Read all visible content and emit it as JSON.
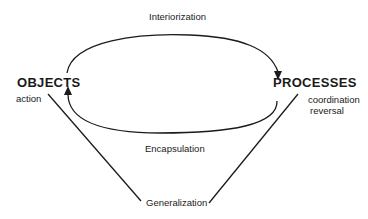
{
  "diagram": {
    "nodes": {
      "objects": {
        "label": "OBJECTS",
        "sublabels": [
          "action"
        ]
      },
      "processes": {
        "label": "PROCESSES",
        "sublabels": [
          "coordination",
          "reversal"
        ]
      }
    },
    "edges": {
      "interiorization": {
        "label": "Interiorization",
        "from": "OBJECTS",
        "to": "PROCESSES",
        "style": "upper arc with arrowhead"
      },
      "encapsulation": {
        "label": "Encapsulation",
        "from": "PROCESSES",
        "to": "OBJECTS",
        "style": "lower arc with arrowhead"
      },
      "generalization": {
        "label": "Generalization",
        "from": "OBJECTS",
        "to": "PROCESSES",
        "style": "V-shaped straight lines meeting at label"
      }
    },
    "colors": {
      "stroke": "#1a1a1a",
      "background": "#ffffff"
    }
  }
}
